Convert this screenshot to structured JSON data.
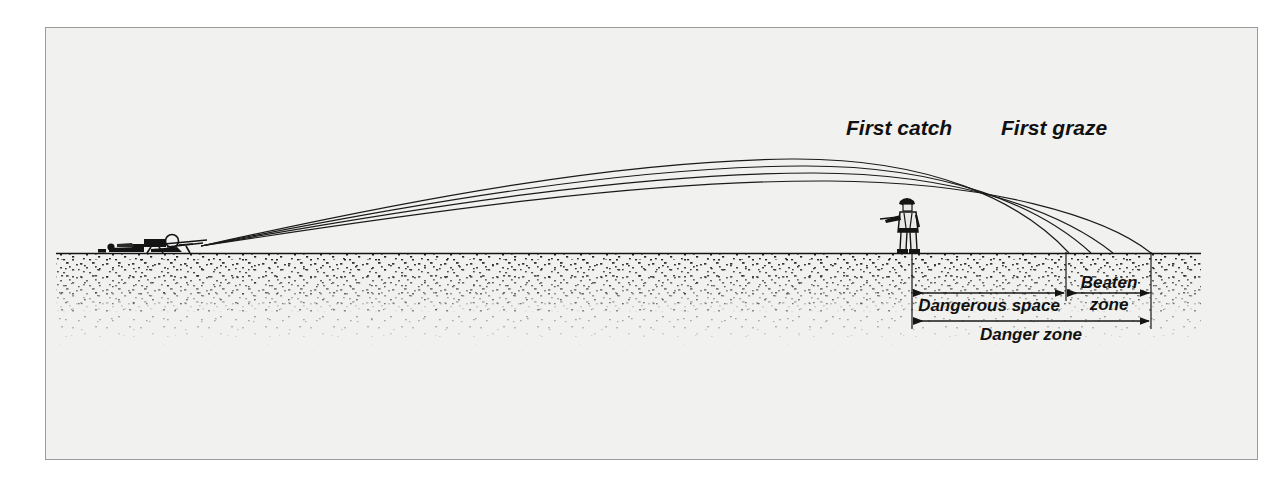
{
  "figure": {
    "kind": "technical-illustration",
    "background_color": "#f1f1ef",
    "page_color": "#ffffff",
    "ink_color": "#141414",
    "frame": {
      "x": 45,
      "y": 27,
      "width": 1213,
      "height": 433,
      "border_color": "#9a9a9a"
    }
  },
  "annotations": {
    "first_catch": "First catch",
    "first_graze": "First graze"
  },
  "dimensions": [
    {
      "id": "dangerous-space",
      "label": "Dangerous space",
      "x_start": 911,
      "x_end": 1065,
      "y": 292
    },
    {
      "id": "beaten-zone",
      "label_line1": "Beaten",
      "label_line2": "zone",
      "x_start": 1065,
      "x_end": 1150,
      "y": 292
    },
    {
      "id": "danger-zone",
      "label": "Danger zone",
      "x_start": 911,
      "x_end": 1150,
      "y": 320
    }
  ],
  "scene": {
    "ground_y": 252,
    "ground_x_start": 55,
    "ground_x_end": 1200,
    "gun_position_x": 160,
    "standing_figure_x": 906,
    "muzzle_x": 200,
    "muzzle_y": 245
  },
  "chart_data": {
    "type": "line",
    "xlabel": "",
    "ylabel": "",
    "grid": false,
    "legend": "none",
    "xlim": [
      55,
      1200
    ],
    "ylim": [
      252,
      150
    ],
    "annotations": [
      "First catch",
      "First graze",
      "Dangerous space",
      "Beaten zone",
      "Danger zone"
    ],
    "series": [
      {
        "name": "trajectory-1-shortest",
        "path": "M 200 245 C 420 196, 620 160, 790 158 C 930 157, 1020 200, 1068 252"
      },
      {
        "name": "trajectory-2",
        "path": "M 200 245 C 425 200, 630 166, 800 165 C 945 164, 1040 206, 1090 252"
      },
      {
        "name": "trajectory-3",
        "path": "M 200 245 C 430 204, 640 172, 812 172 C 960 172, 1062 212, 1112 252"
      },
      {
        "name": "trajectory-4-longest",
        "path": "M 200 245 C 435 209, 650 179, 828 180 C 990 181, 1105 216, 1150 252"
      }
    ]
  }
}
